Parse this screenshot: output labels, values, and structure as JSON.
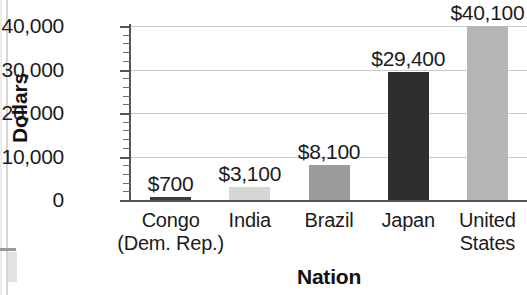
{
  "chart_data": {
    "type": "bar",
    "title": "",
    "xlabel": "Nation",
    "ylabel": "Dollars",
    "categories": [
      "Congo\n(Dem. Rep.)",
      "India",
      "Brazil",
      "Japan",
      "United\nStates"
    ],
    "category_lines": [
      [
        "Congo",
        "(Dem. Rep.)"
      ],
      [
        "India",
        ""
      ],
      [
        "Brazil",
        ""
      ],
      [
        "Japan",
        ""
      ],
      [
        "United",
        "States"
      ]
    ],
    "values": [
      700,
      3100,
      8100,
      29400,
      40100
    ],
    "value_labels": [
      "$700",
      "$3,100",
      "$8,100",
      "$29,400",
      "$40,100"
    ],
    "bar_colors": [
      "#3b3b3b",
      "#d6d6d6",
      "#9c9c9c",
      "#2e2e2e",
      "#b5b5b5"
    ],
    "ylim": [
      0,
      40000
    ],
    "ytick_values": [
      0,
      10000,
      20000,
      30000,
      40000
    ],
    "ytick_labels": [
      "0",
      "10,000",
      "20,000",
      "30,000",
      "40,000"
    ],
    "y_minor_tick_interval": 2000,
    "grid": true,
    "grid_axis": "y",
    "legend": false,
    "legend_position": "none",
    "axis_color": "#555555",
    "gridline_color": "#c9c9c9",
    "text_color": "#1b1b1b"
  },
  "axis_titles": {
    "y": "Dollars",
    "x": "Nation"
  }
}
